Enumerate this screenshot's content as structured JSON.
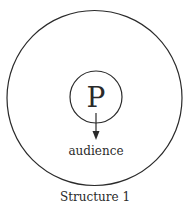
{
  "diagram": {
    "center_label": "P",
    "arrow_target_label": "audience",
    "caption": "Structure 1",
    "colors": {
      "stroke": "#2a2a2a",
      "background": "#ffffff"
    }
  }
}
